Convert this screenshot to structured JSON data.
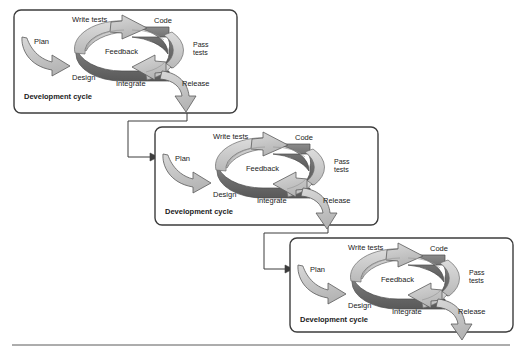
{
  "figure": {
    "kind": "process-diagram",
    "panel_count": 3,
    "colors": {
      "panel_border": "#3d3d3d",
      "page_background": "#ffffff",
      "ring_light": "#c9c9c9",
      "ring_dark": "#6e6e6e",
      "arrow_fill": "#cccccc",
      "arrow_outline": "#555555",
      "connector": "#3d3d3d",
      "text": "#1a1a1a",
      "footer_rule": "#5a5a5a"
    },
    "panels": [
      {
        "id": "cycle-1",
        "caption": "Development cycle",
        "x": 14,
        "y": 10,
        "width": 223,
        "height": 103,
        "labels": {
          "plan": "Plan",
          "write_tests": "Write tests",
          "code": "Code",
          "pass_tests_line1": "Pass",
          "pass_tests_line2": "tests",
          "feedback": "Feedback",
          "integrate": "Integrate",
          "design": "Design",
          "release": "Release"
        }
      },
      {
        "id": "cycle-2",
        "caption": "Development cycle",
        "x": 155,
        "y": 127,
        "width": 223,
        "height": 98,
        "labels": {
          "plan": "Plan",
          "write_tests": "Write tests",
          "code": "Code",
          "pass_tests_line1": "Pass",
          "pass_tests_line2": "tests",
          "feedback": "Feedback",
          "integrate": "Integrate",
          "design": "Design",
          "release": "Release"
        }
      },
      {
        "id": "cycle-3",
        "caption": "Development cycle",
        "x": 290,
        "y": 238,
        "width": 223,
        "height": 94,
        "labels": {
          "plan": "Plan",
          "write_tests": "Write tests",
          "code": "Code",
          "pass_tests_line1": "Pass",
          "pass_tests_line2": "tests",
          "feedback": "Feedback",
          "integrate": "Integrate",
          "design": "Design",
          "release": "Release"
        }
      }
    ],
    "connectors": [
      {
        "id": "release-1-to-cycle-2",
        "from": "cycle-1",
        "to": "cycle-2"
      },
      {
        "id": "release-2-to-cycle-3",
        "from": "cycle-2",
        "to": "cycle-3"
      }
    ],
    "footer_rule": {
      "present": true
    }
  }
}
